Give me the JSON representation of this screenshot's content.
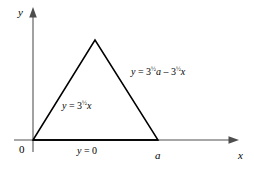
{
  "figure": {
    "name": "equilateral-triangle-region-diagram",
    "background_color": "#ffffff",
    "axis_color": "#808080",
    "line_color": "#000000",
    "axes": {
      "y_axis_label": "y",
      "x_axis_label": "x",
      "origin_label": "0"
    },
    "vertices": {
      "origin_label": "0",
      "right_label": "a"
    },
    "edges": {
      "left_equation": {
        "lhs": "y",
        "eq": "=",
        "base": "3",
        "exponent": "½",
        "var": "x"
      },
      "right_equation": {
        "lhs": "y",
        "eq": "=",
        "base1": "3",
        "exponent1": "½",
        "var1": "a",
        "minus": "–",
        "base2": "3",
        "exponent2": "½",
        "var2": "x"
      },
      "base_equation": {
        "lhs": "y",
        "eq": "=",
        "rhs": "0"
      }
    }
  }
}
